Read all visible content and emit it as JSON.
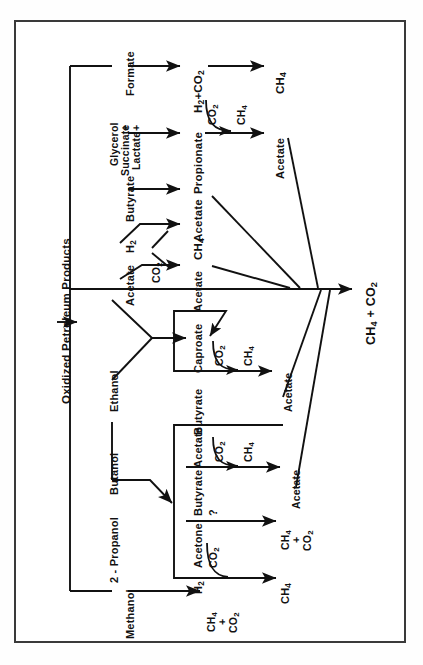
{
  "figure": {
    "kind": "metabolic-pathway-flow-diagram",
    "orientation": "rotated-90-counterclockwise",
    "border_color": "#3a3a3a",
    "line_color": "#111111",
    "background": "#ffffff",
    "input_label": "Oxidized Petroleum Products",
    "final_output": "CH4 + CO2"
  },
  "substrates": {
    "formate": "Formate",
    "glycerol": "Glycerol",
    "plus1": "+",
    "succinate": "Succinate",
    "plus2": "+",
    "lactate": "Lactate",
    "butyrate": "Butyrate",
    "h2": "H2",
    "acetate": "Acetate",
    "ethanol": "Ethanol",
    "butanol": "Butanol",
    "propanol": "2 - Propanol",
    "methanol": "Methanol"
  },
  "intermediates": {
    "h2_co2": "H2+CO2",
    "propionate": "Propionate",
    "acetate_1": "Acetate",
    "ch4_1": "CH4",
    "acetate_2": "Acetate",
    "caproate": "Caproate",
    "butyrate_1": "Butyrate",
    "acetate_3": "Acetate",
    "butyrate_2": "Butyrate",
    "acetone": "Acetone",
    "h2_low": "H2"
  },
  "cofactors": {
    "co2_a": "CO2",
    "co2_b": "CO2",
    "co2_c": "CO2",
    "co2_d": "CO2",
    "co2_e": "CO2",
    "co2_f": "CO2",
    "ch4_a": "CH4",
    "ch4_b": "CH4",
    "ch4_c": "CH4",
    "question": "?"
  },
  "products": {
    "ch4_top": "CH4",
    "acetate_top": "Acetate",
    "acetate_mid": "Acetate",
    "acetate_low": "Acetate",
    "ch4_co2_acetone": "CH4\n+\nCO2",
    "ch4_co2_acetone_l1": "CH4",
    "ch4_co2_acetone_l2": "+",
    "ch4_co2_acetone_l3": "CO2",
    "ch4_h2": "CH4",
    "ch4_co2_methanol_l1": "CH4",
    "ch4_co2_methanol_l2": "+",
    "ch4_co2_methanol_l3": "CO2"
  },
  "reactions": [
    {
      "from": "Formate",
      "to": "H2+CO2",
      "then": "CH4"
    },
    {
      "from": "Glycerol + Succinate + Lactate",
      "to": "Propionate",
      "then": "Acetate",
      "cofactors": [
        "CO2",
        "CH4"
      ]
    },
    {
      "from": "Butyrate",
      "to": "Acetate"
    },
    {
      "from": "H2 + CO2",
      "to": "CH4"
    },
    {
      "from": "Acetate + CO2",
      "to": "Acetate"
    },
    {
      "from": "Acetate + Ethanol",
      "to": "Butyrate / Caproate",
      "cofactors": [
        "CO2"
      ]
    },
    {
      "from": "Butyrate / Caproate",
      "to": "Acetate",
      "cofactors": [
        "CO2",
        "CH4"
      ]
    },
    {
      "from": "Butanol",
      "to": "Acetate / Butyrate / Acetone / H2"
    },
    {
      "from": "Butyrate",
      "to": "Acetate",
      "cofactors": [
        "CO2",
        "CH4"
      ]
    },
    {
      "from": "Acetone",
      "to": "CH4 + CO2",
      "note": "?"
    },
    {
      "from": "H2 + CO2",
      "to": "CH4"
    },
    {
      "from": "Methanol",
      "to": "CH4 + CO2"
    }
  ]
}
